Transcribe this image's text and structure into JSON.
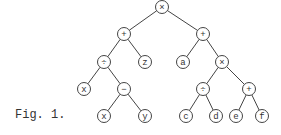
{
  "figure": {
    "caption": "Fig. 1.",
    "nodes": [
      {
        "id": "n0",
        "label": "×",
        "x": 162,
        "y": 7
      },
      {
        "id": "n1",
        "label": "+",
        "x": 124,
        "y": 34
      },
      {
        "id": "n2",
        "label": "÷",
        "x": 104,
        "y": 62
      },
      {
        "id": "n3",
        "label": "z",
        "x": 145,
        "y": 62
      },
      {
        "id": "n4",
        "label": "x",
        "x": 84,
        "y": 89
      },
      {
        "id": "n5",
        "label": "−",
        "x": 124,
        "y": 89
      },
      {
        "id": "n6",
        "label": "x",
        "x": 104,
        "y": 116
      },
      {
        "id": "n7",
        "label": "y",
        "x": 145,
        "y": 116
      },
      {
        "id": "n8",
        "label": "+",
        "x": 203,
        "y": 34
      },
      {
        "id": "n9",
        "label": "a",
        "x": 183,
        "y": 62
      },
      {
        "id": "n10",
        "label": "×",
        "x": 222,
        "y": 62
      },
      {
        "id": "n11",
        "label": "÷",
        "x": 203,
        "y": 89
      },
      {
        "id": "n12",
        "label": "+",
        "x": 249,
        "y": 89
      },
      {
        "id": "n13",
        "label": "c",
        "x": 186,
        "y": 116
      },
      {
        "id": "n14",
        "label": "d",
        "x": 216,
        "y": 116
      },
      {
        "id": "n15",
        "label": "e",
        "x": 236,
        "y": 116
      },
      {
        "id": "n16",
        "label": "f",
        "x": 262,
        "y": 116
      }
    ],
    "edges": [
      [
        "n0",
        "n1"
      ],
      [
        "n0",
        "n8"
      ],
      [
        "n1",
        "n2"
      ],
      [
        "n1",
        "n3"
      ],
      [
        "n2",
        "n4"
      ],
      [
        "n2",
        "n5"
      ],
      [
        "n5",
        "n6"
      ],
      [
        "n5",
        "n7"
      ],
      [
        "n8",
        "n9"
      ],
      [
        "n8",
        "n10"
      ],
      [
        "n10",
        "n11"
      ],
      [
        "n10",
        "n12"
      ],
      [
        "n11",
        "n13"
      ],
      [
        "n11",
        "n14"
      ],
      [
        "n12",
        "n15"
      ],
      [
        "n12",
        "n16"
      ]
    ]
  }
}
